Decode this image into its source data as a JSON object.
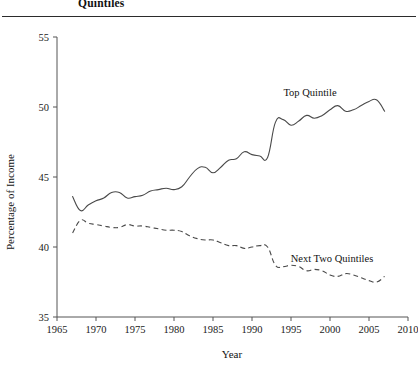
{
  "header": {
    "title_fragment": "Quintiles"
  },
  "axis": {
    "y_title": "Percentage of Income",
    "x_title": "Year",
    "y_ticks": [
      35,
      40,
      45,
      50,
      55
    ],
    "x_ticks": [
      1965,
      1970,
      1975,
      1980,
      1985,
      1990,
      1995,
      2000,
      2005,
      2010
    ]
  },
  "labels": {
    "top_quintile": "Top Quintile",
    "next_two_quintiles": "Next Two Quintiles"
  },
  "colors": {
    "line": "#4a4a4a",
    "axis": "#555555",
    "text": "#111111",
    "rule": "#2b2b2b"
  },
  "chart_data": {
    "type": "line",
    "title": "Quintiles",
    "xlabel": "Year",
    "ylabel": "Percentage of Income",
    "xlim": [
      1965,
      2010
    ],
    "ylim": [
      35,
      55
    ],
    "xticks": [
      1965,
      1970,
      1975,
      1980,
      1985,
      1990,
      1995,
      2000,
      2005,
      2010
    ],
    "yticks": [
      35,
      40,
      45,
      50,
      55
    ],
    "grid": false,
    "legend": "inline-annotations",
    "x": [
      1967,
      1968,
      1969,
      1970,
      1971,
      1972,
      1973,
      1974,
      1975,
      1976,
      1977,
      1978,
      1979,
      1980,
      1981,
      1982,
      1983,
      1984,
      1985,
      1986,
      1987,
      1988,
      1989,
      1990,
      1991,
      1992,
      1993,
      1994,
      1995,
      1996,
      1997,
      1998,
      1999,
      2000,
      2001,
      2002,
      2003,
      2004,
      2005,
      2006,
      2007
    ],
    "series": [
      {
        "name": "Top Quintile",
        "style": "solid",
        "values": [
          43.6,
          42.6,
          43.0,
          43.3,
          43.5,
          43.9,
          43.9,
          43.5,
          43.6,
          43.7,
          44.0,
          44.1,
          44.2,
          44.1,
          44.3,
          45.0,
          45.6,
          45.7,
          45.3,
          45.7,
          46.2,
          46.3,
          46.8,
          46.6,
          46.5,
          46.4,
          48.9,
          49.1,
          48.7,
          49.0,
          49.4,
          49.2,
          49.4,
          49.8,
          50.1,
          49.7,
          49.8,
          50.1,
          50.4,
          50.5,
          49.7
        ]
      },
      {
        "name": "Next Two Quintiles",
        "style": "dashed",
        "values": [
          41.0,
          41.9,
          41.7,
          41.6,
          41.5,
          41.4,
          41.4,
          41.6,
          41.5,
          41.5,
          41.4,
          41.3,
          41.2,
          41.2,
          41.1,
          40.8,
          40.6,
          40.5,
          40.5,
          40.3,
          40.1,
          40.1,
          39.9,
          40.0,
          40.1,
          40.0,
          38.7,
          38.6,
          38.7,
          38.6,
          38.3,
          38.4,
          38.3,
          38.0,
          37.9,
          38.1,
          38.0,
          37.8,
          37.6,
          37.5,
          37.9
        ]
      }
    ]
  }
}
